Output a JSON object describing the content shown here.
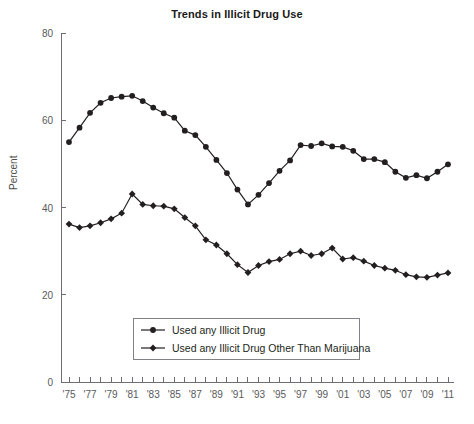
{
  "chart_data": {
    "type": "line",
    "title": "Trends in Illicit Drug Use",
    "xlabel": "",
    "ylabel": "Percent",
    "ylim": [
      0,
      80
    ],
    "yticks": [
      0,
      20,
      40,
      60,
      80
    ],
    "ytick_labels": [
      "0",
      "20",
      "40",
      "60",
      "80"
    ],
    "grid": false,
    "legend_position": "bottom-center",
    "x": [
      1975,
      1976,
      1977,
      1978,
      1979,
      1980,
      1981,
      1982,
      1983,
      1984,
      1985,
      1986,
      1987,
      1988,
      1989,
      1990,
      1991,
      1992,
      1993,
      1994,
      1995,
      1996,
      1997,
      1998,
      1999,
      2000,
      2001,
      2002,
      2003,
      2004,
      2005,
      2006,
      2007,
      2008,
      2009,
      2010,
      2011
    ],
    "xtick_labels": [
      "'75",
      "'77",
      "'79",
      "'81",
      "'83",
      "'85",
      "'87",
      "'89",
      "'91",
      "'93",
      "'95",
      "'97",
      "'99",
      "'01",
      "'03",
      "'05",
      "'07",
      "'09",
      "'11"
    ],
    "xtick_years": [
      1975,
      1977,
      1979,
      1981,
      1983,
      1985,
      1987,
      1989,
      1991,
      1993,
      1995,
      1997,
      1999,
      2001,
      2003,
      2005,
      2007,
      2009,
      2011
    ],
    "series": [
      {
        "name": "Used any Illicit Drug",
        "marker": "circle",
        "color": "#231f20",
        "values": [
          55.0,
          58.3,
          61.7,
          64.0,
          65.1,
          65.4,
          65.6,
          64.4,
          62.9,
          61.6,
          60.6,
          57.6,
          56.6,
          53.9,
          50.9,
          47.9,
          44.1,
          40.7,
          42.9,
          45.6,
          48.4,
          50.8,
          54.3,
          54.1,
          54.7,
          54.0,
          53.9,
          53.0,
          51.1,
          51.1,
          50.4,
          48.2,
          46.8,
          47.4,
          46.7,
          48.2,
          49.9
        ]
      },
      {
        "name": "Used any Illicit Drug Other Than Marijuana",
        "marker": "diamond",
        "color": "#231f20",
        "values": [
          36.2,
          35.4,
          35.8,
          36.5,
          37.4,
          38.7,
          43.1,
          40.7,
          40.4,
          40.3,
          39.7,
          37.7,
          35.8,
          32.6,
          31.4,
          29.4,
          26.9,
          25.1,
          26.7,
          27.6,
          28.1,
          29.4,
          30.0,
          29.0,
          29.4,
          30.7,
          28.2,
          28.5,
          27.7,
          26.7,
          26.1,
          25.6,
          24.6,
          24.1,
          24.0,
          24.5,
          25.0
        ]
      }
    ]
  },
  "legend": {
    "items": [
      {
        "label": "Used any Illicit Drug",
        "marker": "circle"
      },
      {
        "label": "Used any Illicit Drug Other Than Marijuana",
        "marker": "diamond"
      }
    ]
  }
}
